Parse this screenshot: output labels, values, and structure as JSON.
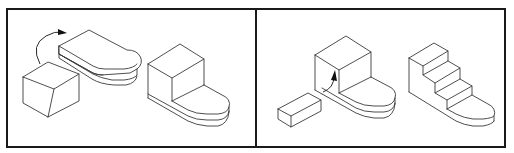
{
  "figure": {
    "colors": {
      "background": "#ffffff",
      "frame": "#1a1a1a",
      "line": "#3a3a3a",
      "arrow": "#111111"
    },
    "panels": [
      {
        "id": "left",
        "parts": [
          {
            "name": "cube",
            "role": "component"
          },
          {
            "name": "rounded-slab",
            "role": "base"
          },
          {
            "name": "rotation-arrow",
            "role": "annotation"
          },
          {
            "name": "assembled-step-block",
            "role": "result"
          }
        ]
      },
      {
        "id": "right",
        "parts": [
          {
            "name": "rectangular-bar",
            "role": "component"
          },
          {
            "name": "cube-on-slab",
            "role": "base"
          },
          {
            "name": "insertion-arrow",
            "role": "annotation"
          },
          {
            "name": "assembled-stair-block",
            "role": "result"
          }
        ]
      }
    ]
  }
}
